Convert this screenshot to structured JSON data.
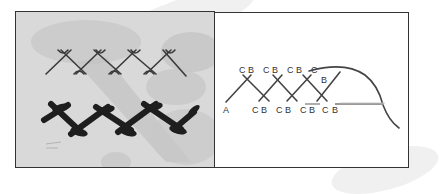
{
  "figure": {
    "photo_panel": {
      "description": "Photograph of herringbone stitches on fabric",
      "rows": [
        {
          "name": "thin-herringbone-row",
          "stitch_count": 4,
          "thread_color": "#3a3a3a"
        },
        {
          "name": "thick-herringbone-row",
          "stitch_count": 4,
          "thread_color": "#1e1e1e"
        }
      ],
      "fabric_color": "#d9d9d9"
    },
    "diagram_panel": {
      "description": "Herringbone stitch working diagram",
      "start_label": "A",
      "top_labels": [
        {
          "c": "C",
          "b": "B"
        },
        {
          "c": "C",
          "b": "B"
        },
        {
          "c": "C",
          "b": "B"
        },
        {
          "c": "C",
          "b": ""
        }
      ],
      "bottom_labels": [
        {
          "c": "C",
          "b": "B"
        },
        {
          "c": "C",
          "b": "B"
        },
        {
          "c": "C",
          "b": "B"
        },
        {
          "c": "C",
          "b": "B"
        }
      ],
      "needle_label_b": "B",
      "line_color": "#444444"
    }
  }
}
